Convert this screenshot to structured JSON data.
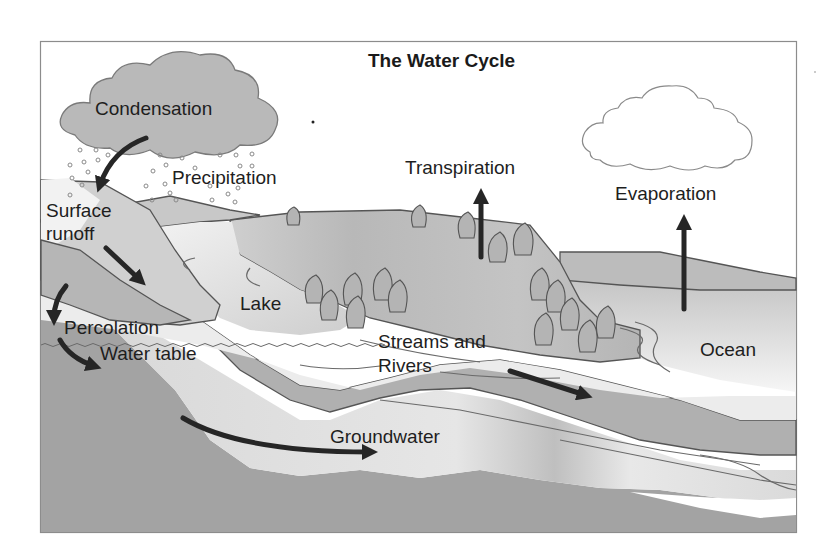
{
  "diagram": {
    "title": "The Water Cycle",
    "labels": {
      "condensation": "Condensation",
      "precipitation": "Precipitation",
      "transpiration": "Transpiration",
      "evaporation": "Evaporation",
      "surface_runoff_line1": "Surface",
      "surface_runoff_line2": "runoff",
      "lake": "Lake",
      "percolation": "Percolation",
      "water_table": "Water table",
      "streams_line1": "Streams and",
      "streams_line2": "Rivers",
      "ocean": "Ocean",
      "groundwater": "Groundwater"
    },
    "colors": {
      "background": "#ffffff",
      "frame": "#8c8c8c",
      "rain_cloud": "#b9b9b9",
      "land_light": "#c8c8c8",
      "land_mid": "#b0b0b0",
      "water_light": "#e4e4e4",
      "bedrock": "#a0a0a0",
      "arrow": "#262626",
      "text": "#1e1e1e"
    }
  }
}
